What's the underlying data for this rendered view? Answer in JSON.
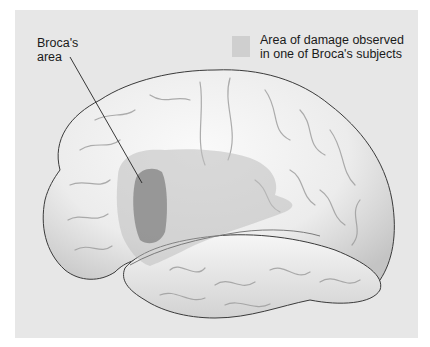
{
  "figure": {
    "labels": {
      "broca_line1": "Broca's",
      "broca_line2": "area"
    },
    "legend": {
      "line1": "Area of damage observed",
      "line2": "in one of Broca's subjects",
      "swatch_color": "#cfcfcf"
    },
    "colors": {
      "panel_background": "#e7e7e7",
      "brain_surface": "#f2f2f2",
      "brain_shadow": "#b9b9b9",
      "damage_region": "#c6c6c6",
      "broca_region": "#8c8c8c",
      "outline": "#3a3a3a"
    }
  }
}
